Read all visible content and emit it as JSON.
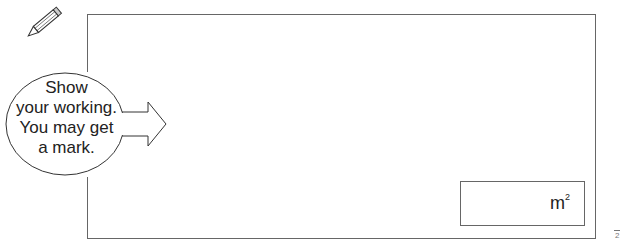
{
  "hint": {
    "lines": [
      "Show",
      "your working.",
      "You may get",
      "a mark."
    ]
  },
  "answer": {
    "unit": "m",
    "unit_power": "2"
  },
  "marks": "2"
}
